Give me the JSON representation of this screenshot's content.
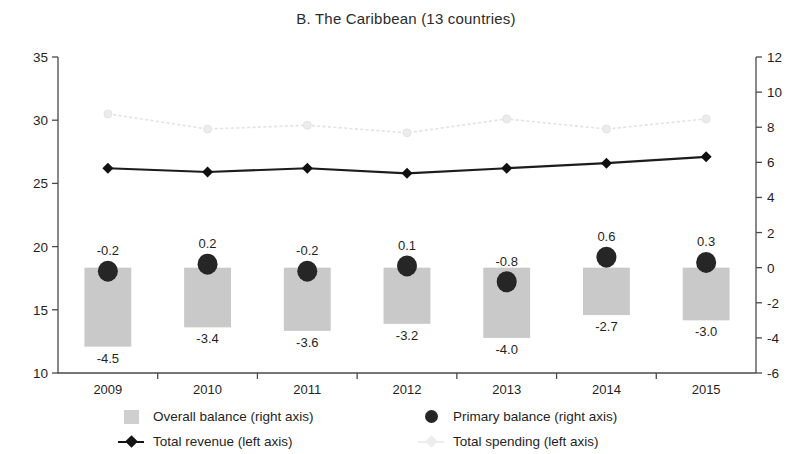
{
  "chart_data": {
    "type": "bar",
    "title": "B. The Caribbean (13 countries)",
    "xlabel": "",
    "ylabel": "",
    "categories": [
      "2009",
      "2010",
      "2011",
      "2012",
      "2013",
      "2014",
      "2015"
    ],
    "left_axis": {
      "label": "left axis",
      "ylim": [
        10,
        35
      ],
      "ticks": [
        "10",
        "15",
        "20",
        "25",
        "30",
        "35"
      ],
      "tick_values": [
        10,
        15,
        20,
        25,
        30,
        35
      ]
    },
    "right_axis": {
      "label": "right axis",
      "ylim": [
        -6,
        12
      ],
      "ticks": [
        "-6",
        "-4",
        "-2",
        "0",
        "2",
        "4",
        "6",
        "8",
        "10",
        "12"
      ],
      "tick_values": [
        -6,
        -4,
        -2,
        0,
        2,
        4,
        6,
        8,
        10,
        12
      ]
    },
    "grid": false,
    "legend_position": "bottom",
    "series": [
      {
        "name": "Overall balance (right axis)",
        "type": "bar",
        "axis": "right",
        "color": "#c9c9c9",
        "values": [
          -4.5,
          -3.4,
          -3.6,
          -3.2,
          -4.0,
          -2.7,
          -3.0
        ],
        "labels": [
          "-4.5",
          "-3.4",
          "-3.6",
          "-3.2",
          "-4.0",
          "-2.7",
          "-3.0"
        ]
      },
      {
        "name": "Primary balance (right axis)",
        "type": "scatter",
        "axis": "right",
        "color": "#262626",
        "values": [
          -0.2,
          0.2,
          -0.2,
          0.1,
          -0.8,
          0.6,
          0.3
        ],
        "labels": [
          "-0.2",
          "0.2",
          "-0.2",
          "0.1",
          "-0.8",
          "0.6",
          "0.3"
        ]
      },
      {
        "name": "Total revenue (left axis)",
        "type": "line",
        "axis": "left",
        "color": "#101010",
        "values": [
          26.2,
          25.9,
          26.2,
          25.8,
          26.2,
          26.6,
          27.1
        ]
      },
      {
        "name": "Total spending (left axis)",
        "type": "line",
        "axis": "left",
        "color": "#e2e2e2",
        "values": [
          30.5,
          29.3,
          29.6,
          29.0,
          30.1,
          29.3,
          30.1
        ]
      }
    ]
  },
  "legend": {
    "items": [
      {
        "label": "Overall balance (right axis)",
        "marker": "bar-swatch-icon"
      },
      {
        "label": "Primary balance (right axis)",
        "marker": "circle-marker-icon"
      },
      {
        "label": "Total revenue (left axis)",
        "marker": "line-diamond-marker-icon"
      },
      {
        "label": "Total spending (left axis)",
        "marker": "line-light-marker-icon"
      }
    ]
  }
}
